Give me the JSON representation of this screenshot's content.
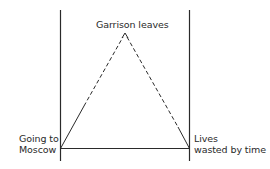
{
  "diagram": {
    "apex_label": "Garrison leaves",
    "left_label": {
      "line1": "Going to",
      "line2": "Moscow"
    },
    "right_label": {
      "line1": "Lives",
      "line2": "wasted by time"
    },
    "colors": {
      "line": "#2a2a2a",
      "background": "#ffffff"
    }
  }
}
